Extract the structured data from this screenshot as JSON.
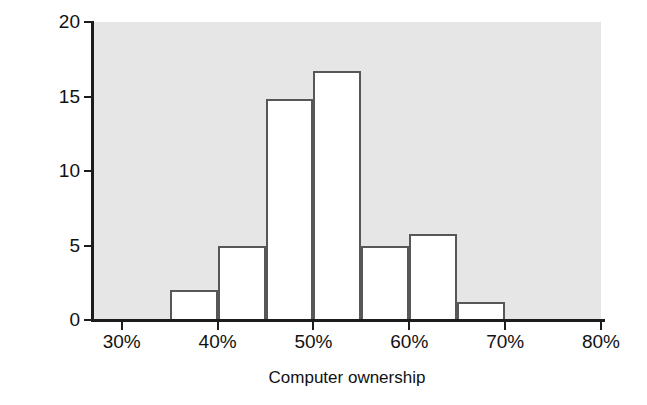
{
  "chart_data": {
    "type": "bar",
    "chart_subtype": "histogram",
    "title": "",
    "xlabel": "Computer ownership",
    "ylabel": "Frequency (number of states)",
    "xlim": [
      27.0,
      80.0
    ],
    "ylim": [
      0,
      20
    ],
    "grid": false,
    "legend": null,
    "bin_width": 5,
    "categories": [
      "35%-40%",
      "40%-45%",
      "45%-50%",
      "50%-55%",
      "55%-60%",
      "60%-65%",
      "65%-70%"
    ],
    "values": [
      2,
      5,
      14.8,
      16.7,
      5,
      5.8,
      1.2
    ],
    "bins": [
      {
        "label": "35%-40%",
        "start": 35,
        "end": 40,
        "value": 2
      },
      {
        "label": "40%-45%",
        "start": 40,
        "end": 45,
        "value": 5
      },
      {
        "label": "45%-50%",
        "start": 45,
        "end": 50,
        "value": 14.8
      },
      {
        "label": "50%-55%",
        "start": 50,
        "end": 55,
        "value": 16.7
      },
      {
        "label": "55%-60%",
        "start": 55,
        "end": 60,
        "value": 5
      },
      {
        "label": "60%-65%",
        "start": 60,
        "end": 65,
        "value": 5.8
      },
      {
        "label": "65%-70%",
        "start": 65,
        "end": 70,
        "value": 1.2
      }
    ],
    "xticks": [
      30,
      40,
      50,
      60,
      70,
      80
    ],
    "xtick_labels": [
      "30%",
      "40%",
      "50%",
      "60%",
      "70%",
      "80%"
    ],
    "yticks": [
      0,
      5,
      10,
      15,
      20
    ],
    "ytick_labels": [
      "0",
      "5",
      "10",
      "15",
      "20"
    ],
    "colors": {
      "plot_background": "#e6e6e6",
      "bar_fill": "#ffffff",
      "bar_edge": "#575757",
      "axis": "#1c1c1c",
      "text": "#111111",
      "figure_background": "#ffffff"
    }
  }
}
